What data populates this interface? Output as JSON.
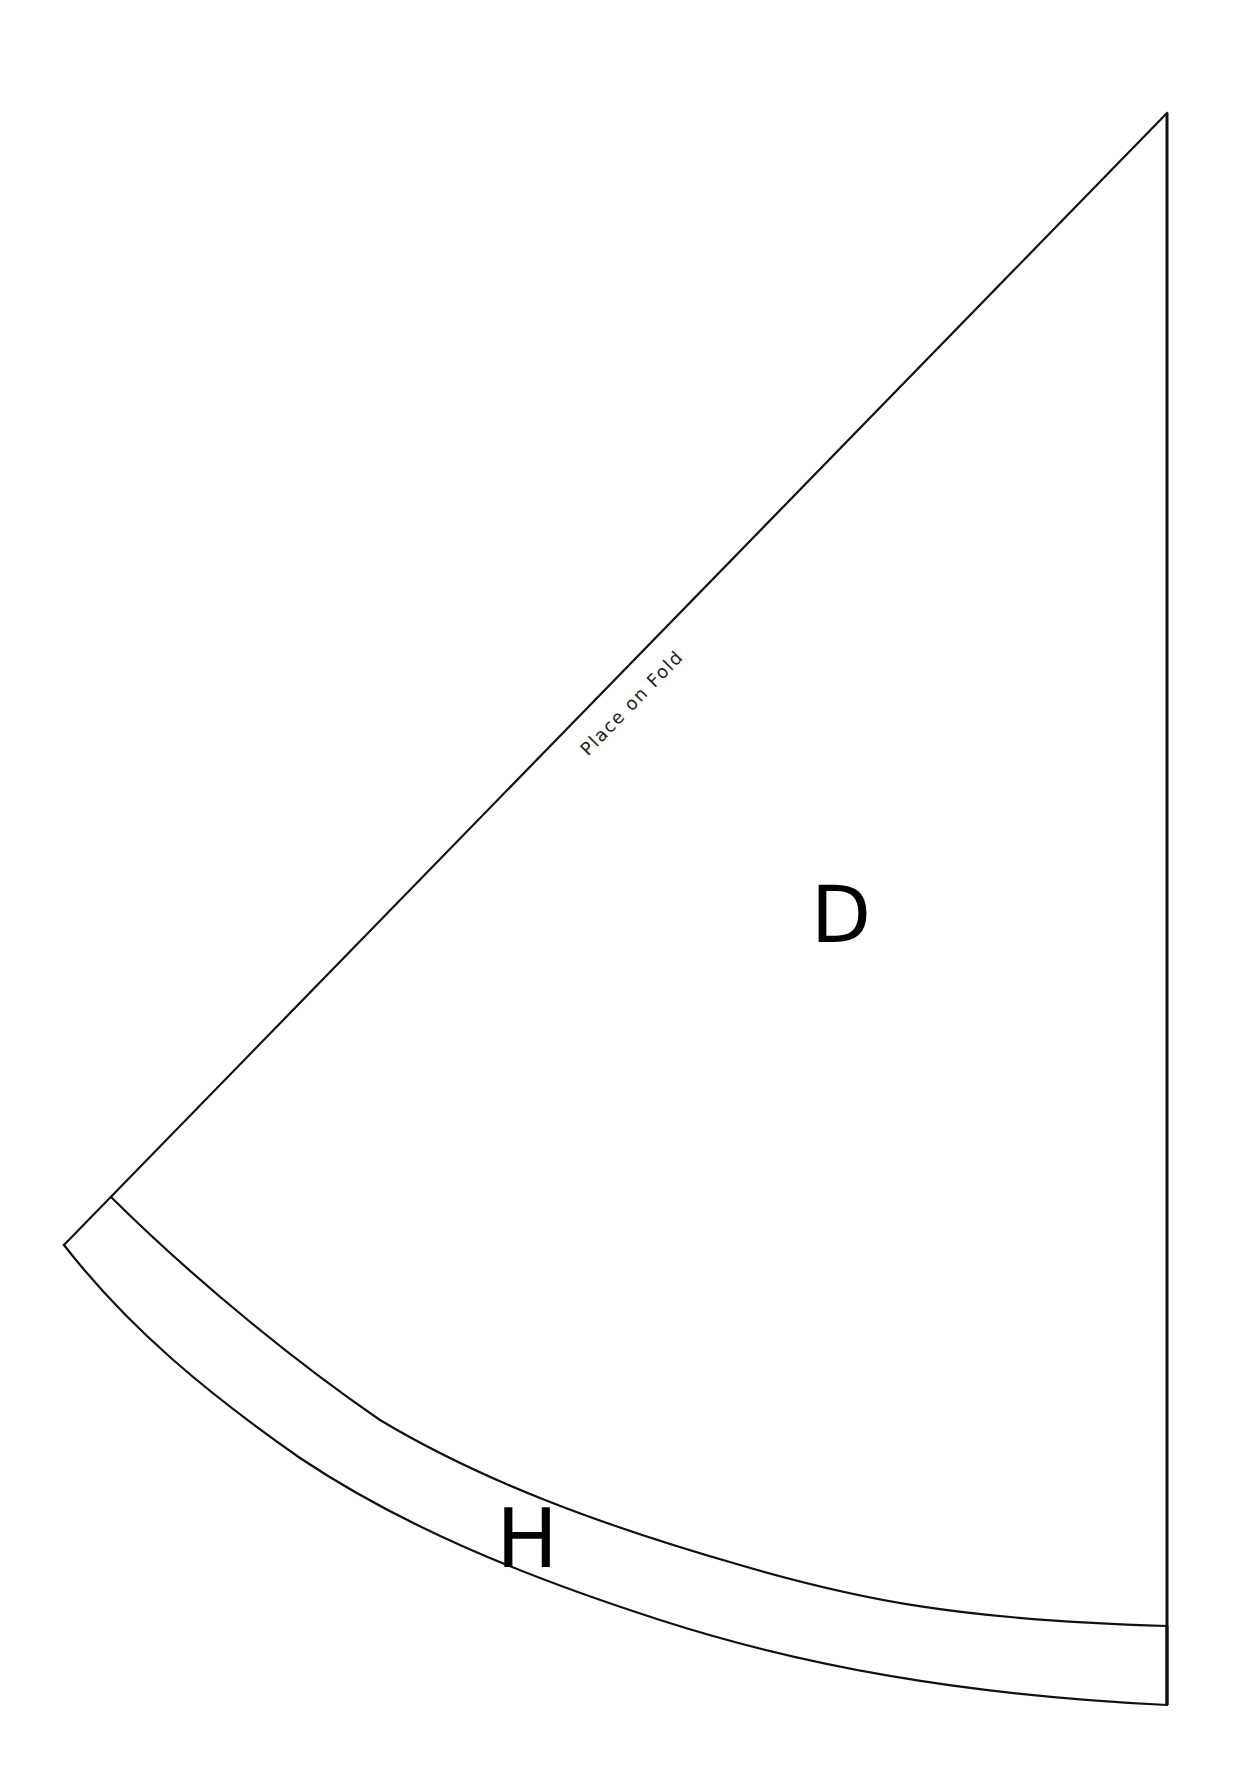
{
  "document": {
    "type": "sewing-pattern-sheet",
    "background_color": "#ffffff",
    "line_color": "#111111"
  },
  "pieces": [
    {
      "id": "D",
      "label": "D",
      "description": "Main quarter-circle skirt panel"
    },
    {
      "id": "H",
      "label": "H",
      "description": "Curved hem band"
    }
  ],
  "annotations": {
    "fold_line_text": "Place on Fold"
  }
}
